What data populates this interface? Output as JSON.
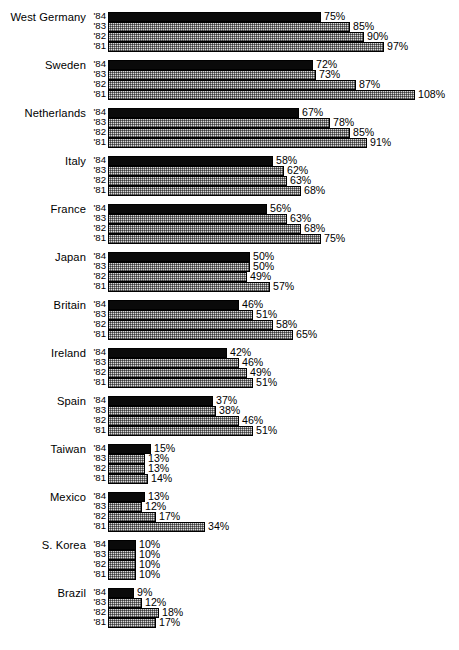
{
  "chart_data": {
    "type": "bar",
    "title": "",
    "subtitle": "",
    "xlabel": "",
    "ylabel": "",
    "orientation": "horizontal",
    "grid": false,
    "legend": false,
    "value_suffix": "%",
    "xlim": [
      0,
      108
    ],
    "series_years": [
      "'84",
      "'83",
      "'82",
      "'81"
    ],
    "series_styles": [
      "solid",
      "hatch",
      "hatch",
      "hatch"
    ],
    "categories": [
      "West Germany",
      "Sweden",
      "Netherlands",
      "Italy",
      "France",
      "Japan",
      "Britain",
      "Ireland",
      "Spain",
      "Taiwan",
      "Mexico",
      "S. Korea",
      "Brazil"
    ],
    "groups": [
      {
        "label": "West Germany",
        "bars": [
          {
            "year": "'84",
            "value": 75,
            "label": "75%",
            "style": "solid"
          },
          {
            "year": "'83",
            "value": 85,
            "label": "85%",
            "style": "hatch"
          },
          {
            "year": "'82",
            "value": 90,
            "label": "90%",
            "style": "hatch"
          },
          {
            "year": "'81",
            "value": 97,
            "label": "97%",
            "style": "hatch"
          }
        ]
      },
      {
        "label": "Sweden",
        "bars": [
          {
            "year": "'84",
            "value": 72,
            "label": "72%",
            "style": "solid"
          },
          {
            "year": "'83",
            "value": 73,
            "label": "73%",
            "style": "hatch"
          },
          {
            "year": "'82",
            "value": 87,
            "label": "87%",
            "style": "hatch"
          },
          {
            "year": "'81",
            "value": 108,
            "label": "108%",
            "style": "hatch"
          }
        ]
      },
      {
        "label": "Netherlands",
        "bars": [
          {
            "year": "'84",
            "value": 67,
            "label": "67%",
            "style": "solid"
          },
          {
            "year": "'83",
            "value": 78,
            "label": "78%",
            "style": "hatch"
          },
          {
            "year": "'82",
            "value": 85,
            "label": "85%",
            "style": "hatch"
          },
          {
            "year": "'81",
            "value": 91,
            "label": "91%",
            "style": "hatch"
          }
        ]
      },
      {
        "label": "Italy",
        "bars": [
          {
            "year": "'84",
            "value": 58,
            "label": "58%",
            "style": "solid"
          },
          {
            "year": "'83",
            "value": 62,
            "label": "62%",
            "style": "hatch"
          },
          {
            "year": "'82",
            "value": 63,
            "label": "63%",
            "style": "hatch"
          },
          {
            "year": "'81",
            "value": 68,
            "label": "68%",
            "style": "hatch"
          }
        ]
      },
      {
        "label": "France",
        "bars": [
          {
            "year": "'84",
            "value": 56,
            "label": "56%",
            "style": "solid"
          },
          {
            "year": "'83",
            "value": 63,
            "label": "63%",
            "style": "hatch"
          },
          {
            "year": "'82",
            "value": 68,
            "label": "68%",
            "style": "hatch"
          },
          {
            "year": "'81",
            "value": 75,
            "label": "75%",
            "style": "hatch"
          }
        ]
      },
      {
        "label": "Japan",
        "bars": [
          {
            "year": "'84",
            "value": 50,
            "label": "50%",
            "style": "solid"
          },
          {
            "year": "'83",
            "value": 50,
            "label": "50%",
            "style": "hatch"
          },
          {
            "year": "'82",
            "value": 49,
            "label": "49%",
            "style": "hatch"
          },
          {
            "year": "'81",
            "value": 57,
            "label": "57%",
            "style": "hatch"
          }
        ]
      },
      {
        "label": "Britain",
        "bars": [
          {
            "year": "'84",
            "value": 46,
            "label": "46%",
            "style": "solid"
          },
          {
            "year": "'83",
            "value": 51,
            "label": "51%",
            "style": "hatch"
          },
          {
            "year": "'82",
            "value": 58,
            "label": "58%",
            "style": "hatch"
          },
          {
            "year": "'81",
            "value": 65,
            "label": "65%",
            "style": "hatch"
          }
        ]
      },
      {
        "label": "Ireland",
        "bars": [
          {
            "year": "'84",
            "value": 42,
            "label": "42%",
            "style": "solid"
          },
          {
            "year": "'83",
            "value": 46,
            "label": "46%",
            "style": "hatch"
          },
          {
            "year": "'82",
            "value": 49,
            "label": "49%",
            "style": "hatch"
          },
          {
            "year": "'81",
            "value": 51,
            "label": "51%",
            "style": "hatch"
          }
        ]
      },
      {
        "label": "Spain",
        "bars": [
          {
            "year": "'84",
            "value": 37,
            "label": "37%",
            "style": "solid"
          },
          {
            "year": "'83",
            "value": 38,
            "label": "38%",
            "style": "hatch"
          },
          {
            "year": "'82",
            "value": 46,
            "label": "46%",
            "style": "hatch"
          },
          {
            "year": "'81",
            "value": 51,
            "label": "51%",
            "style": "hatch"
          }
        ]
      },
      {
        "label": "Taiwan",
        "bars": [
          {
            "year": "'84",
            "value": 15,
            "label": "15%",
            "style": "solid"
          },
          {
            "year": "'83",
            "value": 13,
            "label": "13%",
            "style": "hatch"
          },
          {
            "year": "'82",
            "value": 13,
            "label": "13%",
            "style": "hatch"
          },
          {
            "year": "'81",
            "value": 14,
            "label": "14%",
            "style": "hatch"
          }
        ]
      },
      {
        "label": "Mexico",
        "bars": [
          {
            "year": "'84",
            "value": 13,
            "label": "13%",
            "style": "solid"
          },
          {
            "year": "'83",
            "value": 12,
            "label": "12%",
            "style": "hatch"
          },
          {
            "year": "'82",
            "value": 17,
            "label": "17%",
            "style": "hatch"
          },
          {
            "year": "'81",
            "value": 34,
            "label": "34%",
            "style": "hatch"
          }
        ]
      },
      {
        "label": "S. Korea",
        "bars": [
          {
            "year": "'84",
            "value": 10,
            "label": "10%",
            "style": "solid"
          },
          {
            "year": "'83",
            "value": 10,
            "label": "10%",
            "style": "hatch"
          },
          {
            "year": "'82",
            "value": 10,
            "label": "10%",
            "style": "hatch"
          },
          {
            "year": "'81",
            "value": 10,
            "label": "10%",
            "style": "hatch"
          }
        ]
      },
      {
        "label": "Brazil",
        "bars": [
          {
            "year": "'84",
            "value": 9,
            "label": "9%",
            "style": "solid"
          },
          {
            "year": "'83",
            "value": 12,
            "label": "12%",
            "style": "hatch"
          },
          {
            "year": "'82",
            "value": 18,
            "label": "18%",
            "style": "hatch"
          },
          {
            "year": "'81",
            "value": 17,
            "label": "17%",
            "style": "hatch"
          }
        ]
      }
    ]
  },
  "colors": {
    "background": "#ffffff",
    "bar_solid": "#0a0a0a",
    "bar_hatch_fill": "#d8d8d8",
    "bar_outline": "#000000",
    "text": "#000000"
  },
  "layout": {
    "bar_origin_x": 108,
    "px_per_unit": 2.845,
    "bar_height": 10,
    "bar_pitch": 10,
    "group_pitch": 48,
    "first_group_top": 12
  }
}
